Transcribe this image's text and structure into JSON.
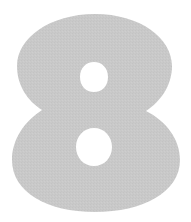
{
  "glyph": {
    "character": "8",
    "fill_color": "#c8c8c8",
    "background_color": "#ffffff"
  }
}
